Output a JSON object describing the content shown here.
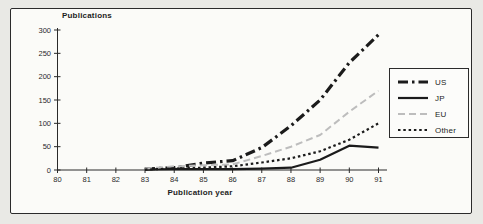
{
  "figure": {
    "outer_background": "#e9e9e5",
    "panel_background": "#fbfbf8",
    "frame_border_color": "#2b2b2b",
    "axis_color": "#2a2a2a",
    "text_color": "#1d1d1d"
  },
  "chart_data": {
    "type": "line",
    "title": "Publications",
    "xlabel": "Publication year",
    "ylabel": "Publications",
    "xlim": [
      80,
      91
    ],
    "ylim": [
      0,
      300
    ],
    "x_axis_ticks": [
      80,
      81,
      82,
      83,
      84,
      85,
      86,
      87,
      88,
      89,
      90,
      91
    ],
    "y_ticks": [
      0,
      50,
      100,
      150,
      200,
      250,
      300
    ],
    "grid": false,
    "legend_position": "right",
    "x": [
      83,
      84,
      85,
      86,
      87,
      88,
      89,
      90,
      91
    ],
    "series": [
      {
        "name": "US",
        "style": "dashdot",
        "color": "#1b1b1b",
        "width": 3.2,
        "values": [
          2,
          5,
          15,
          20,
          48,
          95,
          150,
          230,
          290
        ]
      },
      {
        "name": "JP",
        "style": "solid",
        "color": "#1b1b1b",
        "width": 2.2,
        "values": [
          1,
          2,
          2,
          2,
          3,
          5,
          22,
          52,
          48
        ]
      },
      {
        "name": "EU",
        "style": "dashed",
        "color": "#bdbdbd",
        "width": 2.0,
        "values": [
          3,
          8,
          10,
          12,
          30,
          50,
          75,
          125,
          170
        ]
      },
      {
        "name": "Other",
        "style": "dotted",
        "color": "#1b1b1b",
        "width": 2.2,
        "values": [
          1,
          3,
          5,
          8,
          16,
          25,
          40,
          65,
          100
        ]
      }
    ]
  }
}
